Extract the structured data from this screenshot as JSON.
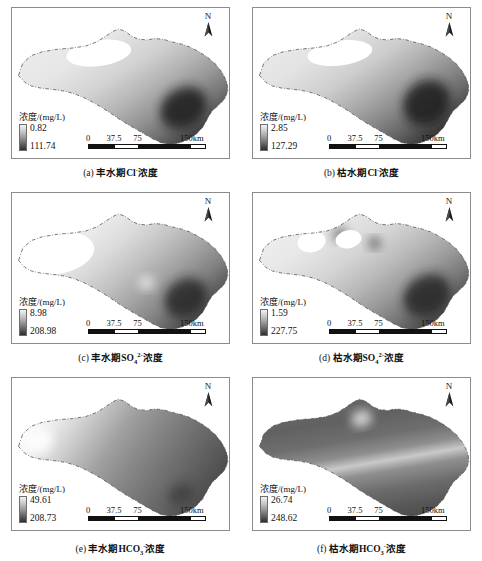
{
  "figure": {
    "columns": 2,
    "rows": 3,
    "scale_bar": {
      "ticks": [
        "0",
        "37.5",
        "75",
        "150km"
      ],
      "tick_positions_pct": [
        0,
        22,
        42,
        88
      ]
    },
    "north_arrow": {
      "label": "N",
      "icon": "north-arrow-icon"
    },
    "legend_title": "浓度/(mg/L)",
    "colors": {
      "frame": "#8c8c8c",
      "text": "#111111",
      "ramp_light": "#f2f2f2",
      "ramp_dark": "#2e2e2e",
      "scale_dark": "#111111",
      "scale_light": "#ffffff"
    }
  },
  "panels": [
    {
      "id": "a",
      "caption_index": "(a)",
      "caption_text": "丰水期Cl",
      "caption_charge": "-",
      "caption_suffix": "浓度",
      "legend_title": "浓度/(mg/L)",
      "min": "0.82",
      "max": "111.74",
      "style": "cl-wet"
    },
    {
      "id": "b",
      "caption_index": "(b)",
      "caption_text": "枯水期Cl",
      "caption_charge": "-",
      "caption_suffix": "浓度",
      "legend_title": "浓度/(mg/L)",
      "min": "2.85",
      "max": "127.29",
      "style": "cl-dry"
    },
    {
      "id": "c",
      "caption_index": "(c)",
      "caption_text": "丰水期SO",
      "caption_sub": "4",
      "caption_charge": "2-",
      "caption_suffix": "浓度",
      "legend_title": "浓度/(mg/L)",
      "min": "8.98",
      "max": "208.98",
      "style": "so4-wet"
    },
    {
      "id": "d",
      "caption_index": "(d)",
      "caption_text": "枯水期SO",
      "caption_sub": "4",
      "caption_charge": "2-",
      "caption_suffix": "浓度",
      "legend_title": "浓度/(mg/L)",
      "min": "1.59",
      "max": "227.75",
      "style": "so4-dry"
    },
    {
      "id": "e",
      "caption_index": "(e)",
      "caption_text": "丰水期HCO",
      "caption_sub": "3",
      "caption_charge": "-",
      "caption_suffix": "浓度",
      "legend_title": "浓度/(mg/L)",
      "min": "49.61",
      "max": "208.73",
      "style": "hco3-wet"
    },
    {
      "id": "f",
      "caption_index": "(f)",
      "caption_text": "枯水期HCO",
      "caption_sub": "3",
      "caption_charge": "-",
      "caption_suffix": "浓度",
      "legend_title": "浓度/(mg/L)",
      "min": "26.74",
      "max": "248.62",
      "style": "hco3-dry"
    }
  ]
}
